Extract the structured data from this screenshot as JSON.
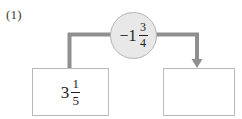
{
  "problem": {
    "number_label": "(1)",
    "type": "function-machine"
  },
  "input": {
    "label": "3 1/5",
    "sign": "",
    "whole": "3",
    "numerator": "1",
    "denominator": "5"
  },
  "operator": {
    "label": "-1 3/4",
    "sign": "−",
    "whole": "1",
    "numerator": "3",
    "denominator": "4"
  },
  "output": {
    "label": "",
    "sign": "",
    "whole": "",
    "numerator": "",
    "denominator": "",
    "is_blank": true
  },
  "connectors": {
    "input_to_operator": {
      "has_arrowhead": false,
      "direction": "up-right"
    },
    "operator_to_output": {
      "has_arrowhead": true,
      "direction": "right-down"
    }
  },
  "colors": {
    "line": "#8f8f8f",
    "box_border": "#b9b9b9",
    "circle_fill": "#e8e8e8",
    "circle_border": "#b4b4b4",
    "text": "#1e1e1e",
    "background": "#ffffff"
  }
}
